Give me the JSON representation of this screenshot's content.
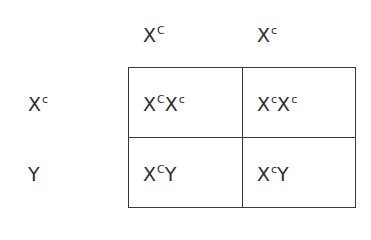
{
  "punnett_square": {
    "column_headers": [
      {
        "base": "X",
        "sup": "C"
      },
      {
        "base": "X",
        "sup": "c"
      }
    ],
    "row_headers": [
      {
        "base": "X",
        "sup": "c"
      },
      {
        "base": "Y",
        "sup": ""
      }
    ],
    "cells": [
      [
        {
          "a_base": "X",
          "a_sup": "C",
          "b_base": "X",
          "b_sup": "c"
        },
        {
          "a_base": "X",
          "a_sup": "c",
          "b_base": "X",
          "b_sup": "c"
        }
      ],
      [
        {
          "a_base": "X",
          "a_sup": "C",
          "b_base": "Y",
          "b_sup": ""
        },
        {
          "a_base": "X",
          "a_sup": "c",
          "b_base": "Y",
          "b_sup": ""
        }
      ]
    ]
  }
}
